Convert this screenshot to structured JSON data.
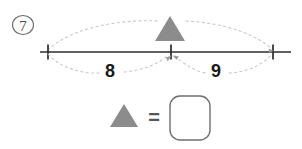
{
  "problem": {
    "number_label": "7",
    "number_label_style": "circled"
  },
  "number_line": {
    "segments": [
      {
        "label": "8",
        "from": "left-tick",
        "to": "middle-tick"
      },
      {
        "label": "9",
        "from": "middle-tick",
        "to": "right-tick"
      }
    ],
    "ticks": [
      {
        "name": "left-tick",
        "x": 48
      },
      {
        "name": "middle-tick",
        "x": 171
      },
      {
        "name": "right-tick",
        "x": 273
      }
    ],
    "marker": {
      "shape": "triangle",
      "color": "#8c8c8c",
      "position": "middle-tick"
    }
  },
  "answer": {
    "symbol_shape": "triangle",
    "symbol_color": "#8c8c8c",
    "equals_sign": "=",
    "box_value": "",
    "box_placeholder": ""
  },
  "colors": {
    "line": "#2b2b2b",
    "dotted_guide": "#c9c9c9",
    "triangle_fill": "#8c8c8c",
    "answer_box_border": "#6e6e6e",
    "text": "#1a1a1a",
    "background": "#ffffff"
  }
}
